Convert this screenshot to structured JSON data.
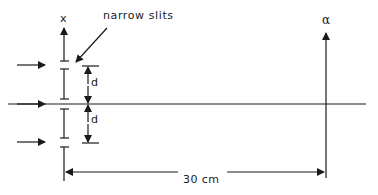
{
  "labels": {
    "x_axis": "x",
    "slits": "narrow slits",
    "slit_separation_upper": "d",
    "slit_separation_lower": "d",
    "screen_axis": "α",
    "distance": "30 cm"
  },
  "colors": {
    "stroke": "#1a1a1a",
    "background": "#ffffff"
  }
}
